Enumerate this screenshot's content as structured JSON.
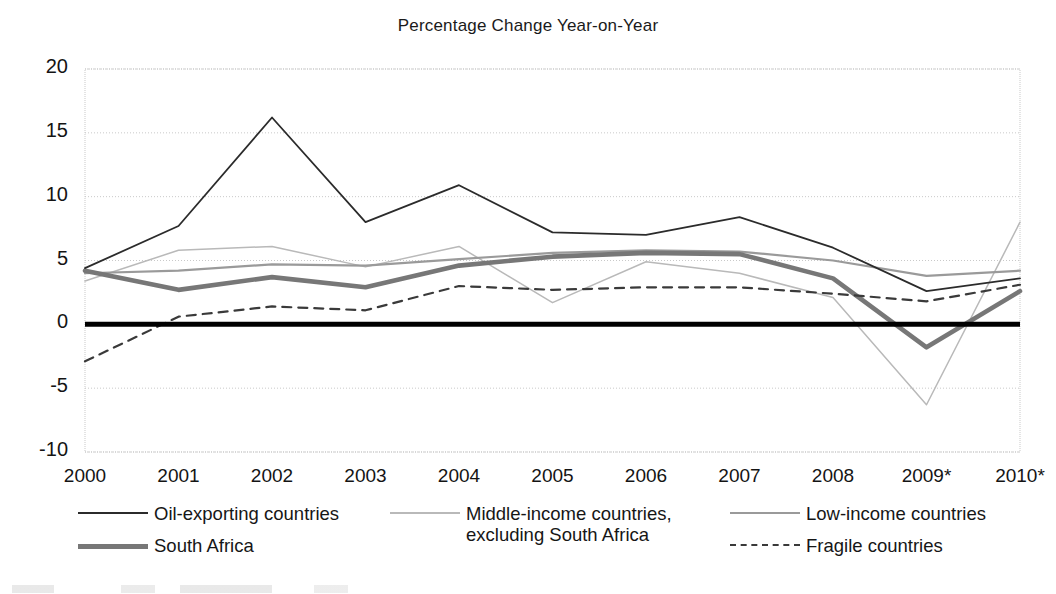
{
  "chart_data": {
    "type": "line",
    "title": "Percentage Change Year-on-Year",
    "xlabel": "",
    "ylabel": "",
    "grid": true,
    "legend_position": "bottom",
    "categories": [
      "2000",
      "2001",
      "2002",
      "2003",
      "2004",
      "2005",
      "2006",
      "2007",
      "2008",
      "2009*",
      "2010*"
    ],
    "x": [
      2000,
      2001,
      2002,
      2003,
      2004,
      2005,
      2006,
      2007,
      2008,
      2009,
      2010
    ],
    "xlim": [
      2000,
      2010
    ],
    "ylim": [
      -10,
      20
    ],
    "yticks": [
      20,
      15,
      10,
      5,
      0,
      -5,
      -10
    ],
    "ytick_labels": [
      "20",
      "15",
      "10",
      "5",
      "0",
      "-5",
      "-10"
    ],
    "zero_line": 0,
    "series": [
      {
        "name": "Oil-exporting countries",
        "key": "oil_exporting",
        "color": "#2b2b2b",
        "width": 1.8,
        "dash": "none",
        "values": [
          4.4,
          7.7,
          16.2,
          8.0,
          10.9,
          7.2,
          7.0,
          8.4,
          6.0,
          2.6,
          3.6
        ]
      },
      {
        "name": "Middle-income countries,\nexcluding South Africa",
        "key": "middle_income_excl_sa",
        "color": "#b9b9b9",
        "width": 1.5,
        "dash": "none",
        "values": [
          3.4,
          5.8,
          6.1,
          4.5,
          6.1,
          1.7,
          4.9,
          4.0,
          2.1,
          -6.3,
          8.0
        ]
      },
      {
        "name": "Low-income countries",
        "key": "low_income",
        "color": "#9a9a9a",
        "width": 2.2,
        "dash": "none",
        "values": [
          4.0,
          4.2,
          4.7,
          4.6,
          5.1,
          5.6,
          5.8,
          5.7,
          5.0,
          3.8,
          4.2
        ]
      },
      {
        "name": "South Africa",
        "key": "south_africa",
        "color": "#777777",
        "width": 4.6,
        "dash": "none",
        "values": [
          4.2,
          2.7,
          3.7,
          2.9,
          4.6,
          5.3,
          5.6,
          5.5,
          3.6,
          -1.8,
          2.6
        ]
      },
      {
        "name": "Fragile countries",
        "key": "fragile",
        "color": "#3a3a3a",
        "width": 2.2,
        "dash": "9,7",
        "values": [
          -2.9,
          0.6,
          1.4,
          1.1,
          3.0,
          2.7,
          2.9,
          2.9,
          2.4,
          1.8,
          3.1
        ]
      }
    ],
    "legend": [
      {
        "label": "Oil-exporting countries",
        "series_key": "oil_exporting",
        "column": 1,
        "row": 1
      },
      {
        "label": "South Africa",
        "series_key": "south_africa",
        "column": 1,
        "row": 2
      },
      {
        "label": "Middle-income countries,\nexcluding South Africa",
        "series_key": "middle_income_excl_sa",
        "column": 2,
        "row": 1
      },
      {
        "label": "Low-income countries",
        "series_key": "low_income",
        "column": 3,
        "row": 1
      },
      {
        "label": "Fragile countries",
        "series_key": "fragile",
        "column": 3,
        "row": 2
      }
    ]
  },
  "axis": {
    "y_labels": [
      "20",
      "15",
      "10",
      "5",
      "0",
      "-5",
      "-10"
    ],
    "x_labels": [
      "2000",
      "2001",
      "2002",
      "2003",
      "2004",
      "2005",
      "2006",
      "2007",
      "2008",
      "2009*",
      "2010*"
    ]
  },
  "legend_text": {
    "oil_exporting": "Oil-exporting countries",
    "south_africa": "South Africa",
    "middle_income_excl_sa": "Middle-income countries,\nexcluding South Africa",
    "low_income": "Low-income countries",
    "fragile": "Fragile countries"
  },
  "colors": {
    "oil_exporting": "#2b2b2b",
    "middle_income_excl_sa": "#b9b9b9",
    "low_income": "#9a9a9a",
    "south_africa": "#777777",
    "fragile": "#3a3a3a",
    "zero_line": "#000000",
    "gridline": "#c9c9c9",
    "plot_border": "#c9c9c9",
    "text": "#141414"
  }
}
